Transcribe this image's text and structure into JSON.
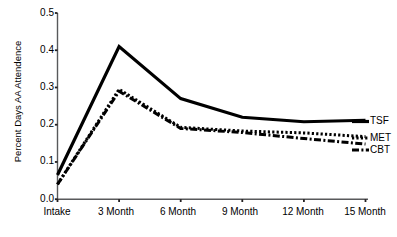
{
  "chart_data": {
    "type": "line",
    "title": "",
    "xlabel": "",
    "ylabel": "Percent Days AA Attendence",
    "categories": [
      "Intake",
      "3 Month",
      "6 Month",
      "9 Month",
      "12 Month",
      "15 Month"
    ],
    "x": [
      0,
      3,
      6,
      9,
      12,
      15
    ],
    "ylim": [
      0.0,
      0.5
    ],
    "ytick_labels": [
      "0.0",
      "0.1",
      "0.2",
      "0.3",
      "0.4",
      "0.5"
    ],
    "ytick_values": [
      0.0,
      0.1,
      0.2,
      0.3,
      0.4,
      0.5
    ],
    "grid": false,
    "legend_position": "right-inline-end-of-line",
    "series": [
      {
        "name": "TSF",
        "label": "TSF",
        "style": "solid",
        "color": "#000000",
        "width": 3.2,
        "values": [
          0.065,
          0.41,
          0.27,
          0.22,
          0.208,
          0.212
        ]
      },
      {
        "name": "MET",
        "label": "MET",
        "style": "dotted",
        "color": "#000000",
        "width": 3.0,
        "values": [
          0.04,
          0.295,
          0.193,
          0.183,
          0.178,
          0.168
        ]
      },
      {
        "name": "CBT",
        "label": "CBT",
        "style": "dash-dot",
        "color": "#000000",
        "width": 3.0,
        "values": [
          0.04,
          0.29,
          0.19,
          0.179,
          0.163,
          0.148
        ]
      }
    ]
  },
  "axis": {
    "y_label": "Percent Days AA Attendence",
    "y_ticks": [
      "0.5",
      "0.4",
      "0.3",
      "0.2",
      "0.1",
      "0.0"
    ],
    "x_ticks": [
      "Intake",
      "3 Month",
      "6 Month",
      "9 Month",
      "12 Month",
      "15 Month"
    ]
  },
  "legend": {
    "tsf": "TSF",
    "met": "MET",
    "cbt": "CBT"
  }
}
